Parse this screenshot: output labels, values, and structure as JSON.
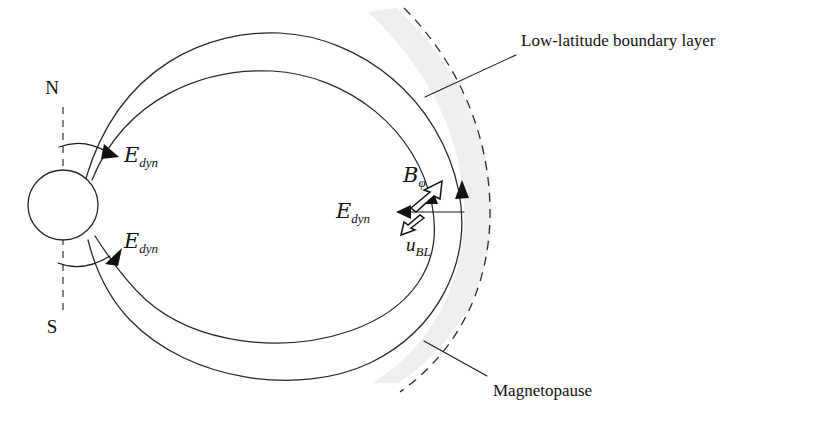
{
  "figure": {
    "domain": "magnetospheric physics schematic",
    "background_color": "#ffffff",
    "line_color": "#262626",
    "band_color": "#efefef",
    "width": 815,
    "height": 424
  },
  "pole_labels": {
    "north": "N",
    "south": "S"
  },
  "annotations": {
    "boundary_layer": "Low-latitude boundary layer",
    "magnetopause": "Magnetopause"
  },
  "math_labels": {
    "e_dyn_north": {
      "symbol": "E",
      "subscript": "dyn"
    },
    "e_dyn_south": {
      "symbol": "E",
      "subscript": "dyn"
    },
    "e_dyn_boundary": {
      "symbol": "E",
      "subscript": "dyn"
    },
    "b_phi": {
      "symbol": "B",
      "subscript": "φ"
    },
    "u_bl": {
      "symbol": "u",
      "subscript": "BL"
    }
  },
  "elements": {
    "planet": {
      "label": "planet",
      "cx": 63,
      "cy": 205,
      "r": 35
    },
    "rotation_axis": {
      "label": "rotation axis (dashed)"
    },
    "outer_field_line": {
      "label": "outer closed field line"
    },
    "inner_field_line": {
      "label": "inner closed field line"
    },
    "magnetopause_arc": {
      "label": "magnetopause (dashed arc)"
    },
    "boundary_layer_band": {
      "label": "low-latitude boundary layer shading"
    }
  }
}
